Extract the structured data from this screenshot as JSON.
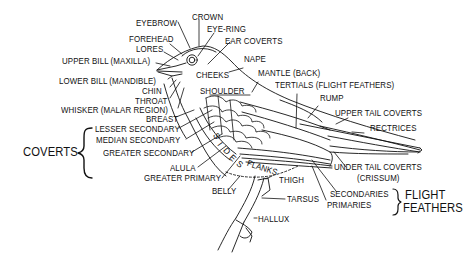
{
  "diagram": {
    "type": "labeled anatomy illustration",
    "labels": {
      "eyebrow": "EYEBROW",
      "crown": "CROWN",
      "eye_ring": "EYE-RING",
      "forehead": "FOREHEAD",
      "ear_coverts": "EAR COVERTS",
      "lores": "LORES",
      "upper_bill": "UPPER BILL (MAXILLA)",
      "nape": "NAPE",
      "cheeks": "CHEEKS",
      "lower_bill": "LOWER BILL (MANDIBLE)",
      "mantle": "MANTLE (BACK)",
      "chin": "CHIN",
      "shoulder": "SHOULDER",
      "tertials": "TERTIALS (FLIGHT FEATHERS)",
      "throat": "THROAT",
      "rump": "RUMP",
      "whisker": "WHISKER (MALAR REGION)",
      "upper_tail_coverts": "UPPER TAIL COVERTS",
      "breast": "BREAST",
      "rectrices": "RECTRICES",
      "lesser_secondary": "LESSER SECONDARY",
      "median_secondary": "MEDIAN SECONDARY",
      "greater_secondary": "GREATER SECONDARY",
      "sides": "SIDES",
      "flanks": "FLANKS",
      "under_tail_coverts": "UNDER TAIL COVERTS",
      "crissum": "(CRISSUM)",
      "alula": "ALULA",
      "greater_primary": "GREATER PRIMARY",
      "thigh": "THIGH",
      "belly": "BELLY",
      "secondaries": "SECONDARIES",
      "primaries": "PRIMARIES",
      "tarsus": "TARSUS",
      "hallux": "HALLUX"
    },
    "groups": {
      "coverts": "COVERTS",
      "flight_feathers_line1": "FLIGHT",
      "flight_feathers_line2": "FEATHERS"
    },
    "sides_letters": [
      "S",
      "I",
      "D",
      "E",
      "S"
    ]
  }
}
